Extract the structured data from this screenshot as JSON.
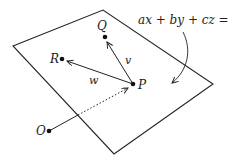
{
  "diagram": {
    "equation": "ax + by + cz = d",
    "points": {
      "P": "P",
      "Q": "Q",
      "R": "R",
      "O": "O"
    },
    "vectors": {
      "v": "v",
      "w": "w"
    },
    "colors": {
      "stroke": "#222222",
      "background": "#ffffff"
    }
  }
}
